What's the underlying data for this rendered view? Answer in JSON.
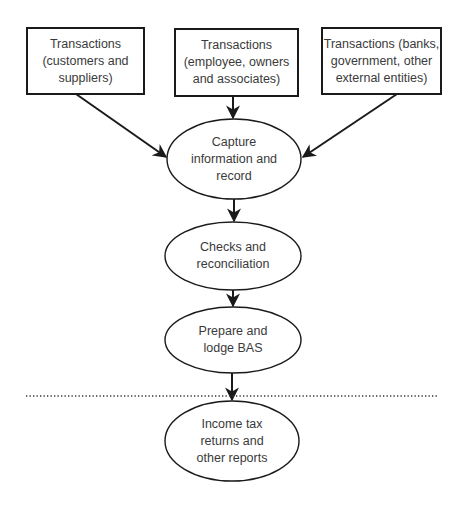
{
  "diagram": {
    "type": "flowchart",
    "colors": {
      "stroke": "#1a1a1a",
      "text": "#3a3a3a",
      "background": "#ffffff"
    },
    "sources": [
      {
        "id": "src-customers",
        "lines": [
          "Transactions",
          "(customers and",
          "suppliers)"
        ]
      },
      {
        "id": "src-employees",
        "lines": [
          "Transactions",
          "(employee, owners",
          "and associates)"
        ]
      },
      {
        "id": "src-external",
        "lines": [
          "Transactions (banks,",
          "government, other",
          "external entities)"
        ]
      }
    ],
    "processes": [
      {
        "id": "capture",
        "lines": [
          "Capture",
          "information and",
          "record"
        ]
      },
      {
        "id": "checks",
        "lines": [
          "Checks and",
          "reconciliation"
        ]
      },
      {
        "id": "bas",
        "lines": [
          "Prepare and",
          "lodge BAS"
        ]
      },
      {
        "id": "income-tax",
        "lines": [
          "Income tax",
          "returns and",
          "other reports"
        ]
      }
    ],
    "edges": [
      {
        "from": "src-customers",
        "to": "capture"
      },
      {
        "from": "src-employees",
        "to": "capture"
      },
      {
        "from": "src-external",
        "to": "capture"
      },
      {
        "from": "capture",
        "to": "checks"
      },
      {
        "from": "checks",
        "to": "bas"
      },
      {
        "from": "bas",
        "to": "income-tax"
      }
    ],
    "separator": {
      "style": "dotted",
      "between": [
        "bas",
        "income-tax"
      ]
    }
  }
}
